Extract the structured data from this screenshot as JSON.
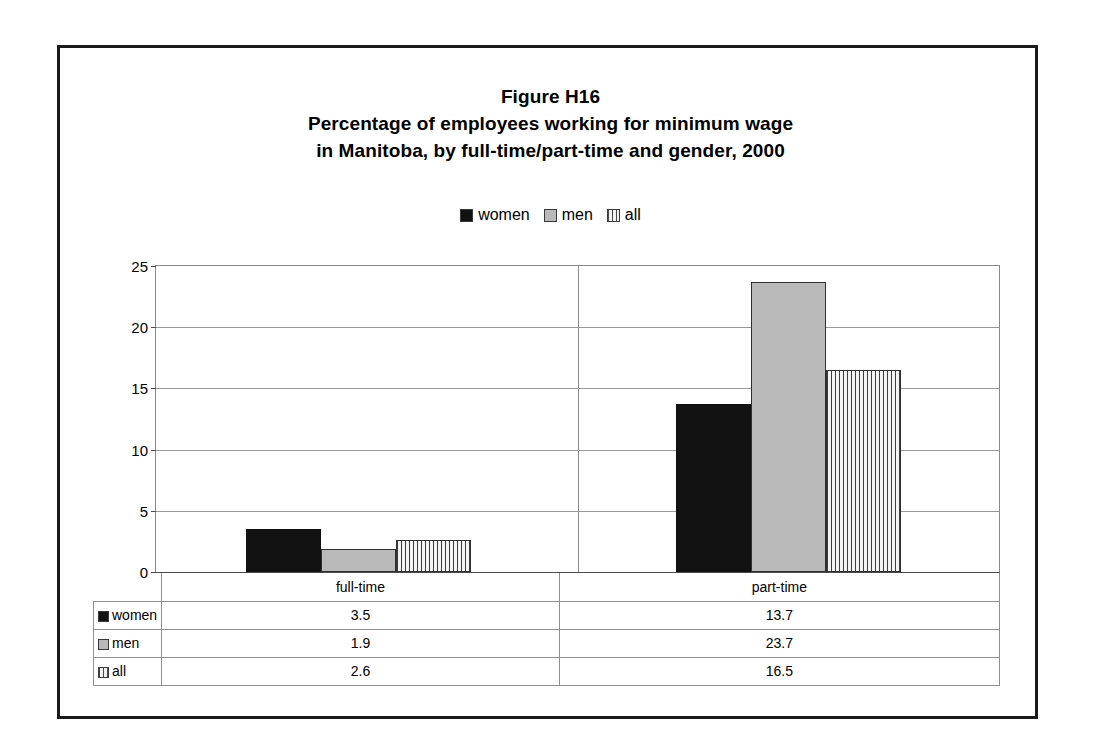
{
  "figure": {
    "title_lines": [
      "Figure H16",
      "Percentage of employees working for minimum wage",
      "in Manitoba, by full-time/part-time and gender, 2000"
    ]
  },
  "legend": {
    "position": "top",
    "items": [
      {
        "label": "women",
        "swatch": "solid-black-swatch",
        "color": "#121212"
      },
      {
        "label": "men",
        "swatch": "solid-gray-swatch",
        "color": "#b9b9b9"
      },
      {
        "label": "all",
        "swatch": "vertical-hatch-swatch",
        "color": "#f2f2f2"
      }
    ]
  },
  "chart_data": {
    "type": "bar",
    "xlabel": "",
    "ylabel": "",
    "categories": [
      "full-time",
      "part-time"
    ],
    "series": [
      {
        "name": "women",
        "values": [
          3.5,
          13.7
        ],
        "color": "#121212",
        "pattern": "solid"
      },
      {
        "name": "men",
        "values": [
          1.9,
          23.7
        ],
        "color": "#b9b9b9",
        "pattern": "solid"
      },
      {
        "name": "all",
        "values": [
          2.6,
          16.5
        ],
        "color": "#f2f2f2",
        "pattern": "vertical-stripes"
      }
    ],
    "ylim": [
      0,
      25
    ],
    "yticks": [
      0,
      5,
      10,
      15,
      20,
      25
    ],
    "ytick_labels": [
      "0",
      "5",
      "10",
      "15",
      "20",
      "25"
    ],
    "grid": true,
    "legend_position": "top"
  },
  "table": {
    "column_headers": [
      "",
      "full-time",
      "part-time"
    ],
    "rows": [
      {
        "key": "women",
        "values": [
          "3.5",
          "13.7"
        ]
      },
      {
        "key": "men",
        "values": [
          "1.9",
          "23.7"
        ]
      },
      {
        "key": "all",
        "values": [
          "2.6",
          "16.5"
        ]
      }
    ]
  }
}
